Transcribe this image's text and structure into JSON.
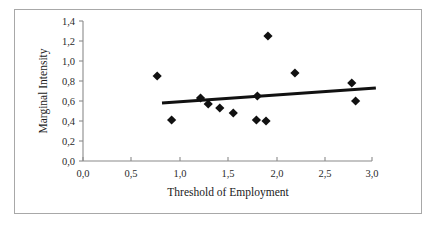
{
  "chart_data": {
    "type": "scatter",
    "title": "",
    "xlabel": "Threshold of Employment",
    "ylabel": "Marginal Intensity",
    "xlim": [
      0.0,
      3.0
    ],
    "ylim": [
      0.0,
      1.4
    ],
    "grid": false,
    "legend": null,
    "decimal_separator": ",",
    "xticks": [
      0.0,
      0.5,
      1.0,
      1.5,
      2.0,
      2.5,
      3.0
    ],
    "xticklabels": [
      "0,0",
      "0,5",
      "1,0",
      "1,5",
      "2,0",
      "2,5",
      "3,0"
    ],
    "yticks": [
      0.0,
      0.2,
      0.4,
      0.6,
      0.8,
      1.0,
      1.2,
      1.4
    ],
    "yticklabels": [
      "0,0",
      "0,2",
      "0,4",
      "0,6",
      "0,8",
      "1,0",
      "1,2",
      "1,4"
    ],
    "series": [
      {
        "name": "observations",
        "marker": "diamond",
        "color": "#111111",
        "points": [
          {
            "x": 0.77,
            "y": 0.85
          },
          {
            "x": 0.92,
            "y": 0.41
          },
          {
            "x": 1.22,
            "y": 0.63
          },
          {
            "x": 1.3,
            "y": 0.57
          },
          {
            "x": 1.42,
            "y": 0.53
          },
          {
            "x": 1.56,
            "y": 0.48
          },
          {
            "x": 1.8,
            "y": 0.41
          },
          {
            "x": 1.81,
            "y": 0.65
          },
          {
            "x": 1.9,
            "y": 0.4
          },
          {
            "x": 1.92,
            "y": 1.25
          },
          {
            "x": 2.2,
            "y": 0.88
          },
          {
            "x": 2.79,
            "y": 0.78
          },
          {
            "x": 2.83,
            "y": 0.6
          }
        ]
      }
    ],
    "trendline": {
      "name": "linear-fit",
      "color": "#111111",
      "x_start": 0.82,
      "y_start": 0.58,
      "x_end": 3.04,
      "y_end": 0.73
    }
  },
  "axis": {
    "x_title": "Threshold of Employment",
    "y_title": "Marginal Intensity"
  },
  "colors": {
    "marker": "#111111",
    "trendline": "#111111",
    "axis": "#8a8a8a",
    "frame": "#a8a8a8",
    "background": "#ffffff",
    "text": "#1a1a1a"
  }
}
